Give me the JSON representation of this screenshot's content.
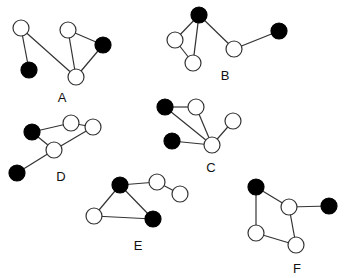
{
  "figure": {
    "width": 346,
    "height": 278,
    "node_radius": 8,
    "colors": {
      "black": "#000000",
      "white": "#ffffff",
      "edge": "#333333"
    },
    "graphs": [
      {
        "label": "A",
        "label_pos": [
          62,
          102
        ],
        "nodes": [
          {
            "x": 21,
            "y": 28,
            "color": "white"
          },
          {
            "x": 29,
            "y": 70,
            "color": "black"
          },
          {
            "x": 68,
            "y": 30,
            "color": "white"
          },
          {
            "x": 103,
            "y": 45,
            "color": "black"
          },
          {
            "x": 76,
            "y": 77,
            "color": "white"
          }
        ],
        "edges": [
          [
            0,
            1
          ],
          [
            0,
            4
          ],
          [
            2,
            4
          ],
          [
            2,
            3
          ],
          [
            3,
            4
          ]
        ]
      },
      {
        "label": "B",
        "label_pos": [
          225,
          80
        ],
        "nodes": [
          {
            "x": 199,
            "y": 15,
            "color": "black"
          },
          {
            "x": 175,
            "y": 40,
            "color": "white"
          },
          {
            "x": 193,
            "y": 63,
            "color": "white"
          },
          {
            "x": 234,
            "y": 49,
            "color": "white"
          },
          {
            "x": 279,
            "y": 31,
            "color": "black"
          }
        ],
        "edges": [
          [
            0,
            1
          ],
          [
            0,
            2
          ],
          [
            1,
            2
          ],
          [
            0,
            3
          ],
          [
            3,
            4
          ]
        ]
      },
      {
        "label": "C",
        "label_pos": [
          211,
          172
        ],
        "nodes": [
          {
            "x": 165,
            "y": 107,
            "color": "black"
          },
          {
            "x": 196,
            "y": 107,
            "color": "white"
          },
          {
            "x": 233,
            "y": 121,
            "color": "white"
          },
          {
            "x": 172,
            "y": 141,
            "color": "black"
          },
          {
            "x": 212,
            "y": 145,
            "color": "white"
          }
        ],
        "edges": [
          [
            0,
            1
          ],
          [
            0,
            4
          ],
          [
            1,
            4
          ],
          [
            3,
            4
          ],
          [
            2,
            4
          ]
        ]
      },
      {
        "label": "D",
        "label_pos": [
          61,
          181
        ],
        "nodes": [
          {
            "x": 32,
            "y": 132,
            "color": "black"
          },
          {
            "x": 71,
            "y": 123,
            "color": "white"
          },
          {
            "x": 93,
            "y": 127,
            "color": "white"
          },
          {
            "x": 54,
            "y": 150,
            "color": "white"
          },
          {
            "x": 17,
            "y": 173,
            "color": "black"
          }
        ],
        "edges": [
          [
            0,
            1
          ],
          [
            1,
            2
          ],
          [
            0,
            3
          ],
          [
            3,
            2
          ],
          [
            3,
            4
          ]
        ]
      },
      {
        "label": "E",
        "label_pos": [
          138,
          250
        ],
        "nodes": [
          {
            "x": 120,
            "y": 185,
            "color": "black"
          },
          {
            "x": 157,
            "y": 182,
            "color": "white"
          },
          {
            "x": 180,
            "y": 194,
            "color": "white"
          },
          {
            "x": 94,
            "y": 216,
            "color": "white"
          },
          {
            "x": 153,
            "y": 219,
            "color": "black"
          }
        ],
        "edges": [
          [
            0,
            1
          ],
          [
            1,
            2
          ],
          [
            0,
            3
          ],
          [
            3,
            4
          ],
          [
            0,
            4
          ]
        ]
      },
      {
        "label": "F",
        "label_pos": [
          297,
          273
        ],
        "nodes": [
          {
            "x": 256,
            "y": 187,
            "color": "black"
          },
          {
            "x": 289,
            "y": 207,
            "color": "white"
          },
          {
            "x": 329,
            "y": 206,
            "color": "black"
          },
          {
            "x": 256,
            "y": 233,
            "color": "white"
          },
          {
            "x": 296,
            "y": 245,
            "color": "white"
          }
        ],
        "edges": [
          [
            0,
            1
          ],
          [
            1,
            2
          ],
          [
            0,
            3
          ],
          [
            3,
            4
          ],
          [
            1,
            4
          ]
        ]
      }
    ]
  }
}
